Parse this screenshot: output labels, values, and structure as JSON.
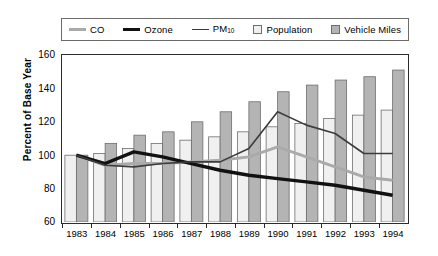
{
  "chart_data": {
    "type": "bar",
    "title": "",
    "subtitle": "",
    "xlabel": "",
    "ylabel": "Percent of Base Year",
    "ylim": [
      60,
      160
    ],
    "ytick_step": 20,
    "yticks": [
      60,
      80,
      100,
      120,
      140,
      160
    ],
    "grid": false,
    "legend_position": "top",
    "categories": [
      "1983",
      "1984",
      "1985",
      "1986",
      "1987",
      "1988",
      "1989",
      "1990",
      "1991",
      "1992",
      "1993",
      "1994"
    ],
    "bar_series": [
      {
        "name": "Population",
        "color": "#f0f0f0",
        "edge_color": "#6e6e6e",
        "values": [
          100,
          101,
          104,
          107,
          109,
          111,
          114,
          117,
          119,
          122,
          124,
          127
        ]
      },
      {
        "name": "Vehicle Miles",
        "color": "#b4b4b4",
        "edge_color": "#6e6e6e",
        "values": [
          100,
          107,
          112,
          114,
          120,
          126,
          132,
          138,
          142,
          145,
          147,
          151
        ]
      }
    ],
    "line_series": [
      {
        "name": "CO",
        "color": "#aaaaaa",
        "width": 3.0,
        "values": [
          100,
          94,
          95,
          95,
          96,
          97,
          99,
          105,
          99,
          93,
          87,
          85
        ]
      },
      {
        "name": "Ozone",
        "color": "#111111",
        "width": 3.4,
        "values": [
          100,
          95,
          102,
          99,
          95,
          91,
          88,
          86,
          84,
          82,
          79,
          76
        ]
      },
      {
        "name": "PM10",
        "color": "#3c3c3c",
        "width": 1.6,
        "values": [
          100,
          94,
          93,
          95,
          96,
          96,
          104,
          126,
          118,
          113,
          101,
          101
        ]
      }
    ]
  },
  "legend": {
    "items": [
      {
        "label": "CO",
        "icon": "line-swatch-co",
        "style": "thick-gray-line"
      },
      {
        "label": "Ozone",
        "icon": "line-swatch-ozone",
        "style": "thick-black-line"
      },
      {
        "label": "PM",
        "sub": "10",
        "icon": "line-swatch-pm10",
        "style": "thin-dark-line"
      },
      {
        "label": "Population",
        "icon": "box-swatch-population",
        "style": "light-box"
      },
      {
        "label": "Vehicle Miles",
        "icon": "box-swatch-vehicle-miles",
        "style": "gray-box"
      }
    ]
  }
}
